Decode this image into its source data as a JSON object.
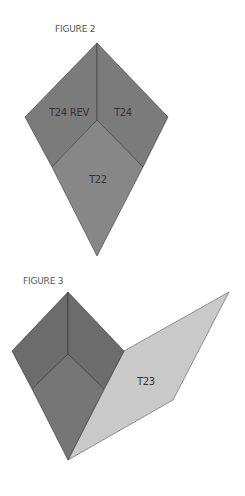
{
  "figures": [
    {
      "title": "FIGURE 2",
      "pieces": [
        {
          "label": "T24 REV",
          "color": "#7b7b7b"
        },
        {
          "label": "T24",
          "color": "#7b7b7b"
        },
        {
          "label": "T22",
          "color": "#878787"
        }
      ]
    },
    {
      "title": "FIGURE 3",
      "pieces": [
        {
          "label": "",
          "color": "#6c6c6c"
        },
        {
          "label": "",
          "color": "#6c6c6c"
        },
        {
          "label": "",
          "color": "#767676"
        },
        {
          "label": "T23",
          "color": "#c9c9c9"
        }
      ]
    }
  ],
  "colors": {
    "edge": "#3a3a3a",
    "background": "#ffffff"
  }
}
